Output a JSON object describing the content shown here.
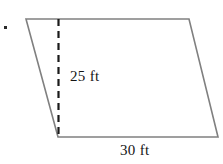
{
  "figure": {
    "name": "parallelogram-with-height",
    "background_color": "#ffffff",
    "outline_color": "#808080",
    "outline_width": 1.6,
    "dash_color": "#1a1a1a",
    "dash_width": 2.2,
    "dash_pattern": "7 5",
    "bullet": {
      "name": "item-bullet",
      "color": "#2a2a2a",
      "x": 4,
      "y": 26,
      "size": 3
    },
    "vertices": {
      "top_left": {
        "x": 26,
        "y": 19
      },
      "top_right": {
        "x": 189,
        "y": 19
      },
      "bottom_right": {
        "x": 218,
        "y": 137
      },
      "bottom_left": {
        "x": 58,
        "y": 137
      }
    },
    "height_line": {
      "name": "height-dashed-line",
      "x": 58.5,
      "y_top": 19,
      "y_bottom": 137
    },
    "labels": {
      "height": "25 ft",
      "base": "30 ft"
    }
  },
  "chart_data": {
    "type": "diagram",
    "shape": "parallelogram",
    "title": "",
    "measurements": [
      {
        "name": "height",
        "value": 25,
        "unit": "ft",
        "label": "25 ft",
        "edge": "altitude"
      },
      {
        "name": "base",
        "value": 30,
        "unit": "ft",
        "label": "30 ft",
        "edge": "bottom"
      }
    ],
    "annotations": [
      "25 ft",
      "30 ft"
    ],
    "polygon_points": [
      [
        26,
        19
      ],
      [
        189,
        19
      ],
      [
        218,
        137
      ],
      [
        58,
        137
      ]
    ],
    "dashed_segments": [
      [
        [
          58.5,
          19
        ],
        [
          58.5,
          137
        ]
      ]
    ]
  }
}
